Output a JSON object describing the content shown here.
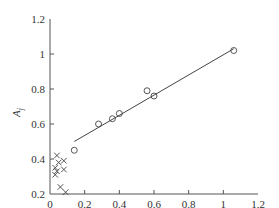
{
  "chart_data": {
    "type": "scatter",
    "title": "",
    "xlabel": "SA",
    "ylabel": "A_j",
    "xlim": [
      0,
      1.2
    ],
    "ylim": [
      0.2,
      1.2
    ],
    "x_ticks": [
      "0",
      "0.2",
      "0.4",
      "0.6",
      "0.8",
      "1",
      "1.2"
    ],
    "y_ticks": [
      "0.2",
      "0.4",
      "0.6",
      "0.8",
      "1",
      "1.2"
    ],
    "grid": false,
    "legend": null,
    "series": [
      {
        "name": "circles",
        "marker": "o",
        "points": [
          [
            0.14,
            0.45
          ],
          [
            0.28,
            0.6
          ],
          [
            0.36,
            0.63
          ],
          [
            0.4,
            0.66
          ],
          [
            0.56,
            0.79
          ],
          [
            0.6,
            0.76
          ],
          [
            1.06,
            1.02
          ]
        ]
      },
      {
        "name": "crosses",
        "marker": "x",
        "points": [
          [
            0.04,
            0.42
          ],
          [
            0.08,
            0.39
          ],
          [
            0.05,
            0.38
          ],
          [
            0.03,
            0.35
          ],
          [
            0.08,
            0.34
          ],
          [
            0.04,
            0.33
          ],
          [
            0.03,
            0.31
          ],
          [
            0.06,
            0.24
          ],
          [
            0.09,
            0.21
          ]
        ]
      },
      {
        "name": "fit line",
        "type": "line",
        "points": [
          [
            0.14,
            0.5
          ],
          [
            1.06,
            1.03
          ]
        ]
      }
    ]
  }
}
